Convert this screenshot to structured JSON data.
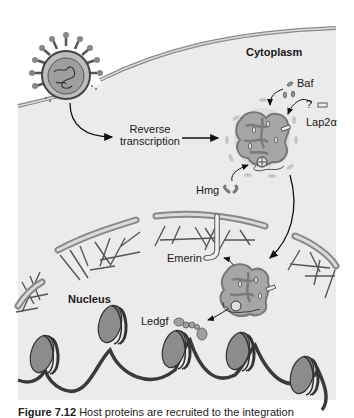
{
  "figure": {
    "labels": {
      "cytoplasm": "Cytoplasm",
      "nucleus": "Nucleus",
      "reverse_transcription_line1": "Reverse",
      "reverse_transcription_line2": "transcription",
      "baf": "Baf",
      "lap2a": "Lap2α",
      "question_mark": "?",
      "hmg": "Hmg",
      "emerin": "Emerin",
      "ledgf": "Ledgf"
    },
    "caption": {
      "number": "Figure 7.12",
      "text": "Host proteins are recruited to the integration"
    },
    "colors": {
      "cell_background": "#ebebeb",
      "membrane": "#9a9a9a",
      "complex_fill": "#a8a8a8",
      "nucleosome_fill": "#8c8c8c",
      "dna": "#3a3a3a"
    }
  }
}
